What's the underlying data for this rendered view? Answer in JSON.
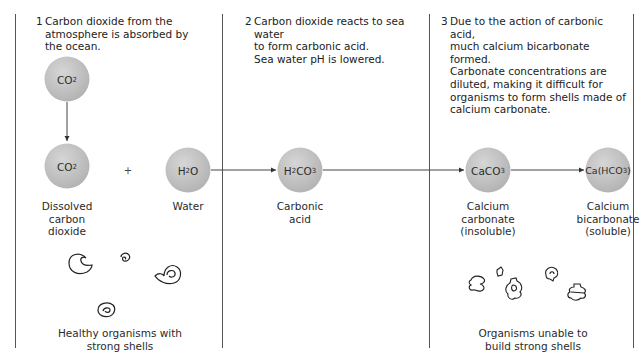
{
  "diagram": {
    "colors": {
      "molecule_fill": "#bdbdbd",
      "line": "#555555",
      "text": "#2b2b2b"
    },
    "steps": [
      {
        "number": "1",
        "text": "Carbon dioxide from the\natmosphere is absorbed by\nthe ocean."
      },
      {
        "number": "2",
        "text": "Carbon dioxide reacts to sea water\nto form carbonic acid.\nSea water pH is lowered."
      },
      {
        "number": "3",
        "text": "Due to the action of carbonic acid,\nmuch calcium bicarbonate formed.\nCarbonate concentrations are\ndiluted, making it difficult for\norganisms to form shells made of\ncalcium carbonate."
      }
    ],
    "molecules": {
      "atmospheric_co2": {
        "base": "CO",
        "sub": "2"
      },
      "dissolved_co2": {
        "base": "CO",
        "sub": "2",
        "label": "Dissolved\ncarbon\ndioxide"
      },
      "water": {
        "base": "H",
        "sub": "2",
        "tail": "O",
        "label": "Water"
      },
      "carbonic_acid": {
        "base": "H",
        "sub": "2",
        "tail": "CO",
        "sub2": "3",
        "label": "Carbonic\nacid"
      },
      "calcium_carbonate": {
        "base": "CaCO",
        "sub": "3",
        "label": "Calcium\ncarbonate\n(insoluble)"
      },
      "calcium_bicarbonate": {
        "base": "Ca(HCO",
        "sub": "3",
        "tail": ")",
        "label": "Calcium\nbicarbonate\n(soluble)"
      }
    },
    "plus_sign": "+",
    "captions": {
      "healthy": "Healthy organisms with\nstrong shells",
      "unhealthy": "Organisms unable to\nbuild strong shells"
    },
    "icons": {
      "healthy_shell": "spiral-shell-icon",
      "damaged_shell": "damaged-shell-icon"
    }
  }
}
